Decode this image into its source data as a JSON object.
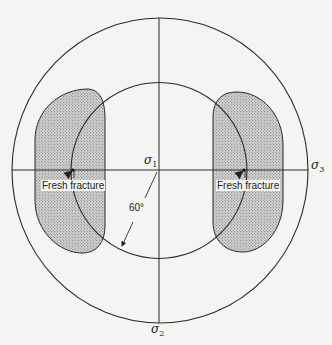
{
  "diagram": {
    "type": "stereographic-projection",
    "axes": {
      "sigma1": {
        "symbol": "σ",
        "sub": "1"
      },
      "sigma2": {
        "symbol": "σ",
        "sub": "2"
      },
      "sigma3": {
        "symbol": "σ",
        "sub": "3"
      }
    },
    "angle_label": "60°",
    "regions": [
      {
        "name": "left-shaded-region",
        "label": "Fresh fracture"
      },
      {
        "name": "right-shaded-region",
        "label": "Fresh fracture"
      }
    ],
    "colors": {
      "background": "#f4f4f2",
      "line": "#2a2a2a",
      "shading": "#9a9a9a"
    }
  }
}
